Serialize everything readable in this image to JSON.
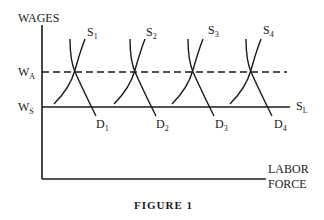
{
  "diagram": {
    "title": "FIGURE 1",
    "y_axis_label": "WAGES",
    "x_axis_label_line1": "LABOR",
    "x_axis_label_line2": "FORCE",
    "wage_levels": [
      {
        "name": "W",
        "sub": "A",
        "style": "dashed"
      },
      {
        "name": "W",
        "sub": "S",
        "style": "solid"
      }
    ],
    "supply_line_label": {
      "name": "S",
      "sub": "L"
    },
    "supply_curves": [
      {
        "name": "S",
        "sub": "1"
      },
      {
        "name": "S",
        "sub": "2"
      },
      {
        "name": "S",
        "sub": "3"
      },
      {
        "name": "S",
        "sub": "4"
      }
    ],
    "demand_curves": [
      {
        "name": "D",
        "sub": "1"
      },
      {
        "name": "D",
        "sub": "2"
      },
      {
        "name": "D",
        "sub": "3"
      },
      {
        "name": "D",
        "sub": "4"
      }
    ]
  }
}
